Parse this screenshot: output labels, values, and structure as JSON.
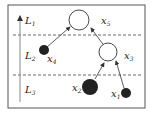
{
  "diagram": {
    "layers": [
      {
        "id": "L1",
        "label": "L",
        "sub": "1"
      },
      {
        "id": "L2",
        "label": "L",
        "sub": "2"
      },
      {
        "id": "L3",
        "label": "L",
        "sub": "3"
      }
    ],
    "nodes": [
      {
        "id": "x1",
        "label": "x",
        "sub": "1",
        "fill": "#222222",
        "layer": "L3"
      },
      {
        "id": "x2",
        "label": "x",
        "sub": "2",
        "fill": "#222222",
        "layer": "L3"
      },
      {
        "id": "x3",
        "label": "x",
        "sub": "3",
        "fill": "#ffffff",
        "layer": "L2"
      },
      {
        "id": "x4",
        "label": "x",
        "sub": "4",
        "fill": "#222222",
        "layer": "L2"
      },
      {
        "id": "x5",
        "label": "x",
        "sub": "5",
        "fill": "#ffffff",
        "layer": "L1"
      }
    ],
    "edges": [
      {
        "from": "x4",
        "to": "x5"
      },
      {
        "from": "x3",
        "to": "x5"
      },
      {
        "from": "x2",
        "to": "x3"
      },
      {
        "from": "x1",
        "to": "x3"
      }
    ]
  }
}
